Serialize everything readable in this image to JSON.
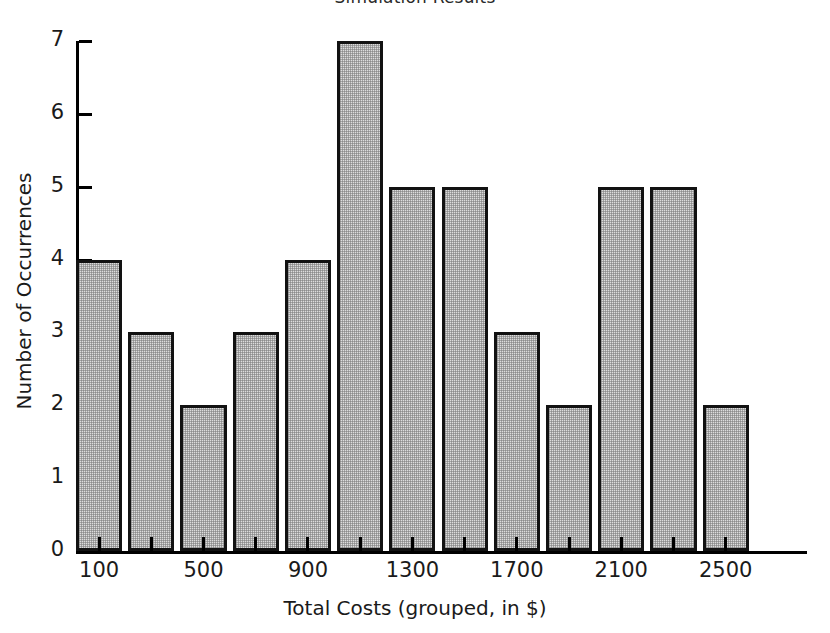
{
  "chart_data": {
    "type": "bar",
    "title": "Simulation Results",
    "xlabel": "Total Costs (grouped, in $)",
    "ylabel": "Number of Occurrences",
    "grid": false,
    "legend": null,
    "legend_position": "none",
    "ylim": [
      0,
      7
    ],
    "xlim": [
      0,
      2600
    ],
    "ytick_labels": [
      "0",
      "1",
      "2",
      "3",
      "4",
      "5",
      "6",
      "7"
    ],
    "ytick_values": [
      0,
      1,
      2,
      3,
      4,
      5,
      6,
      7
    ],
    "xtick_labels": [
      "100",
      "500",
      "900",
      "1300",
      "1700",
      "2100",
      "2500"
    ],
    "xtick_values": [
      100,
      500,
      900,
      1300,
      1700,
      2100,
      2500
    ],
    "bin_width": 200,
    "categories": [
      100,
      300,
      500,
      700,
      900,
      1100,
      1300,
      1500,
      1700,
      1900,
      2100,
      2300,
      2500
    ],
    "values": [
      4,
      3,
      2,
      3,
      4,
      7,
      5,
      5,
      3,
      2,
      5,
      5,
      2
    ],
    "bar_fill_color": "#dcdcdc",
    "bar_edge_color": "#121212",
    "background_color": "#ffffff"
  }
}
